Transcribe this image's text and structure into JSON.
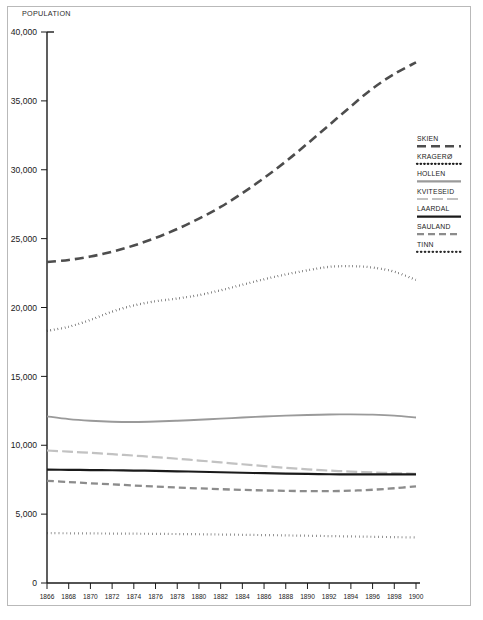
{
  "figure": {
    "y_axis_title": "POPULATION",
    "background_color": "#ffffff",
    "border_color": "#b9b9b9"
  },
  "chart_data": {
    "type": "line",
    "title": "",
    "subtitle": "",
    "xlabel": "",
    "ylabel": "POPULATION",
    "xlim": [
      1866,
      1900
    ],
    "ylim": [
      0,
      40000
    ],
    "grid": false,
    "legend_position": "right",
    "y_ticks": [
      0,
      5000,
      10000,
      15000,
      20000,
      25000,
      30000,
      35000,
      40000
    ],
    "y_tick_labels": [
      "0",
      "5,000",
      "10,000",
      "15,000",
      "20,000",
      "25,000",
      "30,000",
      "35,000",
      "40,000"
    ],
    "x_ticks": [
      1866,
      1868,
      1870,
      1872,
      1874,
      1876,
      1878,
      1880,
      1882,
      1884,
      1886,
      1888,
      1890,
      1892,
      1894,
      1896,
      1898,
      1900
    ],
    "x_tick_labels": [
      "1866",
      "1868",
      "1870",
      "1872",
      "1874",
      "1876",
      "1878",
      "1880",
      "1882",
      "1884",
      "1886",
      "1888",
      "1890",
      "1892",
      "1894",
      "1896",
      "1898",
      "1900"
    ],
    "x": [
      1866,
      1868,
      1870,
      1872,
      1874,
      1876,
      1878,
      1880,
      1882,
      1884,
      1886,
      1888,
      1890,
      1892,
      1894,
      1896,
      1898,
      1900
    ],
    "series": [
      {
        "name": "SKIEN",
        "color": "#4d4d4d",
        "width": 2.6,
        "dash": "9,5",
        "values": [
          23300,
          23450,
          23700,
          24050,
          24500,
          25050,
          25700,
          26450,
          27300,
          28300,
          29400,
          30600,
          31900,
          33250,
          34600,
          35900,
          36950,
          37800
        ]
      },
      {
        "name": "KRAGERØ",
        "color": "#1f1f1f",
        "width": 2.3,
        "dash": "0.5,3.1",
        "values": [
          18300,
          18600,
          19100,
          19700,
          20150,
          20450,
          20650,
          20900,
          21250,
          21650,
          22050,
          22400,
          22700,
          22950,
          23000,
          22900,
          22600,
          22000
        ]
      },
      {
        "name": "HOLLEN",
        "color": "#9a9a9a",
        "width": 1.9,
        "dash": "none",
        "values": [
          12100,
          11900,
          11780,
          11710,
          11690,
          11720,
          11780,
          11850,
          11930,
          12010,
          12090,
          12150,
          12200,
          12230,
          12240,
          12220,
          12150,
          12010
        ]
      },
      {
        "name": "KVITESEID",
        "color": "#c2c2c2",
        "width": 2.2,
        "dash": "11,4",
        "values": [
          9620,
          9540,
          9450,
          9350,
          9250,
          9140,
          9020,
          8890,
          8760,
          8620,
          8490,
          8360,
          8250,
          8160,
          8090,
          8030,
          7980,
          7930
        ]
      },
      {
        "name": "LAARDAL",
        "color": "#1a1a1a",
        "width": 2.2,
        "dash": "none",
        "values": [
          8230,
          8215,
          8200,
          8185,
          8165,
          8140,
          8110,
          8075,
          8040,
          8005,
          7970,
          7940,
          7915,
          7895,
          7885,
          7880,
          7880,
          7885
        ]
      },
      {
        "name": "SAULAND",
        "color": "#8c8c8c",
        "width": 2.3,
        "dash": "7,4",
        "values": [
          7420,
          7330,
          7240,
          7160,
          7080,
          7000,
          6930,
          6870,
          6810,
          6760,
          6720,
          6690,
          6670,
          6670,
          6700,
          6770,
          6880,
          7020
        ]
      },
      {
        "name": "TINN",
        "color": "#2b2b2b",
        "width": 2.2,
        "dash": "0.5,3.4",
        "values": [
          3620,
          3610,
          3600,
          3590,
          3580,
          3570,
          3555,
          3540,
          3520,
          3500,
          3480,
          3455,
          3430,
          3405,
          3380,
          3355,
          3330,
          3310
        ]
      }
    ]
  },
  "legend": {
    "items": [
      {
        "label": "SKIEN"
      },
      {
        "label": "KRAGERØ"
      },
      {
        "label": "HOLLEN"
      },
      {
        "label": "KVITESEID"
      },
      {
        "label": "LAARDAL"
      },
      {
        "label": "SAULAND"
      },
      {
        "label": "TINN"
      }
    ]
  }
}
